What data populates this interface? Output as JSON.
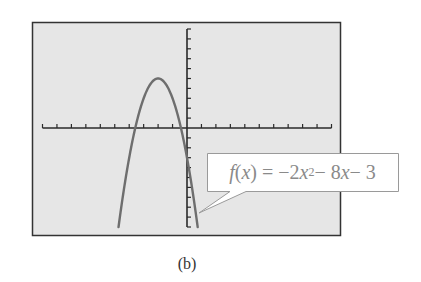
{
  "caption": "(b)",
  "callout": {
    "fname": "f",
    "arg": "x",
    "equals": "=",
    "lead": "−2",
    "var1": "x",
    "exp": "2",
    "mid": " − 8",
    "var2": "x",
    "tail": " − 3"
  },
  "colors": {
    "screen_bg": "#e6e6e6",
    "frame": "#333333",
    "axis": "#2a2a2a",
    "curve": "#6e6e6e",
    "callout_bg": "#ffffff",
    "callout_border": "#9a9a9a",
    "callout_text": "#8a8a8a"
  },
  "chart_data": {
    "type": "line",
    "title": "",
    "function": "f(x) = -2x^2 - 8x - 3",
    "xlabel": "",
    "ylabel": "",
    "xlim": [
      -10,
      10
    ],
    "ylim": [
      -10,
      10
    ],
    "xscl": 1,
    "yscl": 1,
    "grid": false,
    "legend": null,
    "vertex": [
      -2,
      5
    ],
    "x_intercepts": [
      -3.58,
      -0.42
    ],
    "y_intercept": -3,
    "series": [
      {
        "name": "f(x) = -2x^2 - 8x - 3",
        "x": [
          -4.74,
          -4.5,
          -4,
          -3.5,
          -3,
          -2.5,
          -2,
          -1.5,
          -1,
          -0.5,
          0,
          0.5,
          0.74
        ],
        "y": [
          -10,
          -7.5,
          -3,
          0.5,
          3,
          4.5,
          5,
          4.5,
          3,
          0.5,
          -3,
          -7.5,
          -10
        ]
      }
    ],
    "annotations": [
      {
        "text": "f(x) = −2x² − 8x − 3",
        "points_to": [
          0.7,
          -9.5
        ]
      }
    ],
    "caption": "(b)"
  }
}
